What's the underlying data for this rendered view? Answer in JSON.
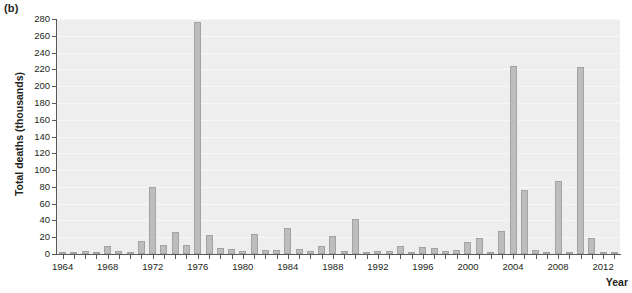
{
  "figure": {
    "panel_label": "(b)",
    "ylabel": "Total deaths (thousands)",
    "xlabel": "Year"
  },
  "chart_data": {
    "type": "bar",
    "title": "",
    "subtitle": "",
    "xlabel": "Year",
    "ylabel": "Total deaths (thousands)",
    "ylim": [
      0,
      280
    ],
    "xlim": [
      1963.5,
      2013.5
    ],
    "ytick_step": 20,
    "yticks": [
      0,
      20,
      40,
      60,
      80,
      100,
      120,
      140,
      160,
      180,
      200,
      220,
      240,
      260,
      280
    ],
    "ytick_labels": [
      "0",
      "20",
      "40",
      "60",
      "80",
      "100",
      "120",
      "140",
      "160",
      "180",
      "200",
      "220",
      "240",
      "260",
      "280"
    ],
    "xticks": [
      1964,
      1965,
      1966,
      1967,
      1968,
      1969,
      1970,
      1971,
      1972,
      1973,
      1974,
      1975,
      1976,
      1977,
      1978,
      1979,
      1980,
      1981,
      1982,
      1983,
      1984,
      1985,
      1986,
      1987,
      1988,
      1989,
      1990,
      1991,
      1992,
      1993,
      1994,
      1995,
      1996,
      1997,
      1998,
      1999,
      2000,
      2001,
      2002,
      2003,
      2004,
      2005,
      2006,
      2007,
      2008,
      2009,
      2010,
      2011,
      2012,
      2013
    ],
    "xtick_labels_shown": [
      "1964",
      "1968",
      "1972",
      "1976",
      "1980",
      "1984",
      "1988",
      "1992",
      "1996",
      "2000",
      "2004",
      "2008",
      "2012"
    ],
    "grid": "horizontal",
    "legend": "none",
    "bar_color": "#bdbdbd",
    "bar_edge_color": "#a3a3a3",
    "plot_background": "#eeeeee",
    "categories": [
      1964,
      1965,
      1966,
      1967,
      1968,
      1969,
      1970,
      1971,
      1972,
      1973,
      1974,
      1975,
      1976,
      1977,
      1978,
      1979,
      1980,
      1981,
      1982,
      1983,
      1984,
      1985,
      1986,
      1987,
      1988,
      1989,
      1990,
      1991,
      1992,
      1993,
      1994,
      1995,
      1996,
      1997,
      1998,
      1999,
      2000,
      2001,
      2002,
      2003,
      2004,
      2005,
      2006,
      2007,
      2008,
      2009,
      2010,
      2011,
      2012,
      2013
    ],
    "values": [
      1,
      1,
      4,
      2,
      10,
      4,
      1,
      16,
      80,
      11,
      26,
      11,
      276,
      23,
      7,
      6,
      3,
      24,
      5,
      5,
      31,
      6,
      3,
      10,
      21,
      4,
      42,
      2,
      4,
      4,
      9,
      2,
      8,
      7,
      3,
      5,
      14,
      19,
      2,
      27,
      224,
      76,
      5,
      2,
      87,
      2,
      223,
      19,
      1,
      1
    ]
  }
}
